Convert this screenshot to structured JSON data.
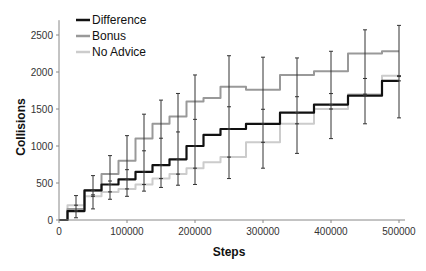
{
  "chart_data": {
    "type": "line",
    "title": "",
    "xlabel": "Steps",
    "ylabel": "Collisions",
    "xlim": [
      0,
      500000
    ],
    "ylim": [
      0,
      2700
    ],
    "x_ticks": [
      "0",
      "100000",
      "200000",
      "300000",
      "400000",
      "500000"
    ],
    "y_ticks": [
      "0",
      "500",
      "1000",
      "1500",
      "2000",
      "2500"
    ],
    "grid": false,
    "legend_position": "top-left",
    "x": [
      0,
      25000,
      50000,
      75000,
      100000,
      125000,
      150000,
      175000,
      200000,
      225000,
      250000,
      300000,
      350000,
      400000,
      450000,
      500000
    ],
    "series": [
      {
        "name": "Difference",
        "color": "#111111",
        "values": [
          0,
          120,
          400,
          480,
          550,
          650,
          740,
          820,
          1000,
          1150,
          1230,
          1300,
          1450,
          1560,
          1680,
          1880
        ]
      },
      {
        "name": "Bonus",
        "color": "#999999",
        "values": [
          0,
          150,
          400,
          620,
          800,
          1100,
          1300,
          1400,
          1600,
          1650,
          1800,
          1760,
          1960,
          2010,
          2250,
          2280
        ]
      },
      {
        "name": "No Advice",
        "color": "#cccccc",
        "values": [
          0,
          200,
          320,
          380,
          420,
          480,
          560,
          620,
          700,
          780,
          850,
          1050,
          1300,
          1500,
          1700,
          1950
        ]
      }
    ],
    "error_bars": {
      "x": [
        25000,
        50000,
        75000,
        100000,
        125000,
        150000,
        175000,
        200000,
        250000,
        300000,
        350000,
        400000,
        450000,
        500000
      ],
      "low": [
        30,
        150,
        280,
        320,
        390,
        440,
        470,
        480,
        560,
        700,
        900,
        1100,
        1300,
        1380
      ],
      "high": [
        330,
        600,
        870,
        1140,
        1430,
        1620,
        1710,
        1960,
        2220,
        2200,
        2190,
        2280,
        2570,
        2630
      ]
    }
  },
  "legend": {
    "items": [
      {
        "label": "Difference",
        "color": "#111111"
      },
      {
        "label": "Bonus",
        "color": "#999999"
      },
      {
        "label": "No Advice",
        "color": "#cccccc"
      }
    ]
  }
}
